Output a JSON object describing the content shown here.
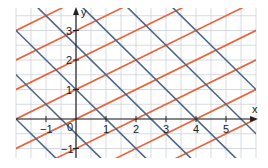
{
  "chart_data": {
    "type": "line",
    "title": "",
    "xlabel": "x",
    "ylabel": "y",
    "xlim": [
      -2,
      6
    ],
    "ylim": [
      -1.3,
      3.8
    ],
    "grid": true,
    "grid_step": 0.5,
    "x_ticks": [
      -1,
      1,
      2,
      3,
      4,
      5
    ],
    "y_ticks": [
      -1,
      1,
      2,
      3
    ],
    "origin_label": "0",
    "series": [
      {
        "name": "orange family (slope 1/2)",
        "color": "#e8643c",
        "slope": 0.5,
        "intercepts": [
          -3,
          -2,
          -1,
          0,
          1,
          2,
          3,
          4
        ]
      },
      {
        "name": "blue family (slope -1)",
        "color": "#4b6686",
        "slope": -1,
        "intercepts": [
          -2,
          -0.5,
          1,
          2.5,
          4,
          5.5,
          7
        ]
      }
    ]
  },
  "colors": {
    "grid": "#ccd0d8",
    "axis": "#222222",
    "orange": "#e8643c",
    "blue": "#4b6686"
  }
}
